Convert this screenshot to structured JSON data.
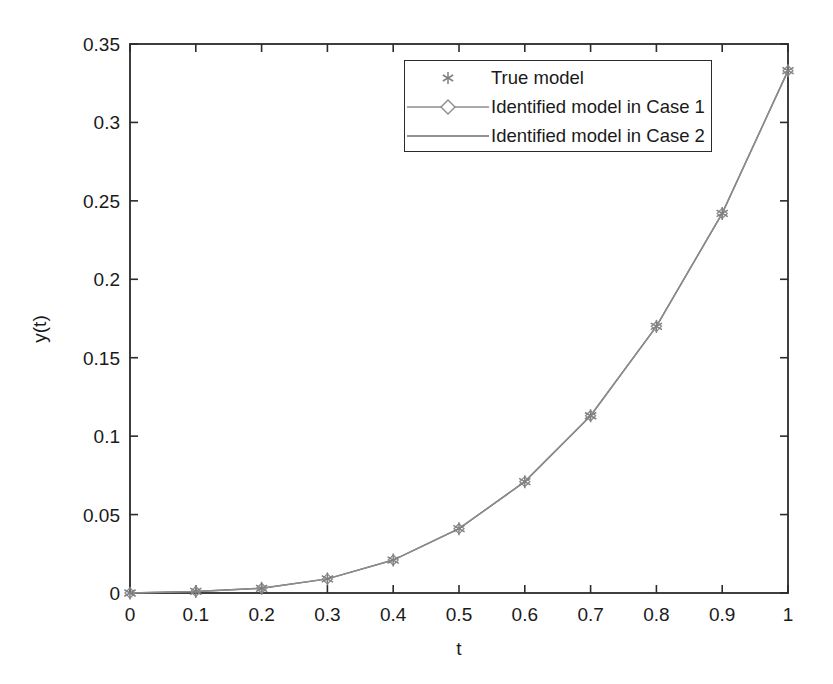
{
  "chart_data": {
    "type": "line",
    "title": "",
    "xlabel": "t",
    "ylabel": "y(t)",
    "xlim": [
      0,
      1
    ],
    "ylim": [
      0,
      0.35
    ],
    "grid": false,
    "legend_position": "upper center",
    "xticks": [
      0,
      0.1,
      0.2,
      0.3,
      0.4,
      0.5,
      0.6,
      0.7,
      0.8,
      0.9,
      1
    ],
    "xtick_labels": [
      "0",
      "0.1",
      "0.2",
      "0.3",
      "0.4",
      "0.5",
      "0.6",
      "0.7",
      "0.8",
      "0.9",
      "1"
    ],
    "yticks": [
      0,
      0.05,
      0.1,
      0.15,
      0.2,
      0.25,
      0.3,
      0.35
    ],
    "ytick_labels": [
      "0",
      "0.05",
      "0.1",
      "0.15",
      "0.2",
      "0.25",
      "0.3",
      "0.35"
    ],
    "x": [
      0,
      0.1,
      0.2,
      0.3,
      0.4,
      0.5,
      0.6,
      0.7,
      0.8,
      0.9,
      1
    ],
    "series": [
      {
        "name": "True model",
        "marker": "asterisk",
        "line": "none",
        "color": "#808080",
        "values": [
          0,
          0.001,
          0.003,
          0.009,
          0.021,
          0.041,
          0.071,
          0.113,
          0.17,
          0.242,
          0.333
        ]
      },
      {
        "name": "Identified model in Case 1",
        "marker": "diamond",
        "line": "solid",
        "color": "#8c8c8c",
        "values": [
          0,
          0.001,
          0.003,
          0.009,
          0.021,
          0.041,
          0.071,
          0.113,
          0.17,
          0.242,
          0.333
        ]
      },
      {
        "name": "Identified model in Case 2",
        "marker": "none",
        "line": "solid",
        "color": "#6e6e6e",
        "values": [
          0,
          0.001,
          0.003,
          0.009,
          0.021,
          0.041,
          0.071,
          0.113,
          0.17,
          0.242,
          0.333
        ]
      }
    ]
  },
  "legend": {
    "items": [
      {
        "label": "True model"
      },
      {
        "label": "Identified model in Case 1"
      },
      {
        "label": "Identified model in Case 2"
      }
    ]
  },
  "axes": {
    "xlabel": "t",
    "ylabel": "y(t)"
  }
}
